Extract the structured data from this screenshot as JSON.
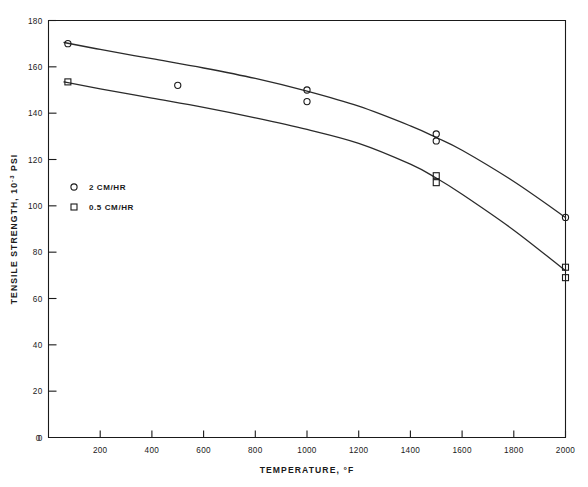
{
  "chart_data": {
    "type": "scatter",
    "title": "",
    "xlabel": "TEMPERATURE, °F",
    "ylabel": "TENSILE STRENGTH, 10⁻³ PSI",
    "ylabel_main": "TENSILE STRENGTH, 10",
    "ylabel_exponent": "-3",
    "ylabel_tail": " PSI",
    "xlim": [
      0,
      2000
    ],
    "ylim": [
      0,
      180
    ],
    "grid": false,
    "legend_position": "inside-left",
    "xticks": [
      0,
      200,
      400,
      600,
      800,
      1000,
      1200,
      1400,
      1600,
      1800,
      2000
    ],
    "xticklabels": [
      "0",
      "200",
      "400",
      "600",
      "800",
      "1000",
      "1200",
      "1400",
      "1600",
      "1800",
      "2000"
    ],
    "yticks": [
      0,
      20,
      40,
      60,
      80,
      100,
      120,
      140,
      160,
      180
    ],
    "yticklabels": [
      "0",
      "20",
      "40",
      "60",
      "80",
      "100",
      "120",
      "140",
      "160",
      "180"
    ],
    "series": [
      {
        "name": "2 CM/HR",
        "marker": "circle",
        "points": [
          {
            "x": 75,
            "y": 170
          },
          {
            "x": 500,
            "y": 152
          },
          {
            "x": 1000,
            "y": 150
          },
          {
            "x": 1000,
            "y": 145
          },
          {
            "x": 1500,
            "y": 131
          },
          {
            "x": 1500,
            "y": 128
          },
          {
            "x": 2000,
            "y": 95
          }
        ],
        "fit_curve": [
          {
            "x": 60,
            "y": 170.5
          },
          {
            "x": 200,
            "y": 167.5
          },
          {
            "x": 400,
            "y": 163.5
          },
          {
            "x": 600,
            "y": 159.5
          },
          {
            "x": 800,
            "y": 155
          },
          {
            "x": 1000,
            "y": 149.5
          },
          {
            "x": 1200,
            "y": 143
          },
          {
            "x": 1400,
            "y": 134.5
          },
          {
            "x": 1500,
            "y": 129.5
          },
          {
            "x": 1600,
            "y": 124
          },
          {
            "x": 1800,
            "y": 110.5
          },
          {
            "x": 2000,
            "y": 95
          }
        ]
      },
      {
        "name": "0.5 CM/HR",
        "marker": "square",
        "points": [
          {
            "x": 75,
            "y": 153.5
          },
          {
            "x": 1500,
            "y": 113
          },
          {
            "x": 1500,
            "y": 110
          },
          {
            "x": 2000,
            "y": 73.5
          },
          {
            "x": 2000,
            "y": 69
          }
        ],
        "fit_curve": [
          {
            "x": 60,
            "y": 153.5
          },
          {
            "x": 200,
            "y": 150.5
          },
          {
            "x": 400,
            "y": 146.5
          },
          {
            "x": 600,
            "y": 142.5
          },
          {
            "x": 800,
            "y": 138
          },
          {
            "x": 1000,
            "y": 133
          },
          {
            "x": 1200,
            "y": 127
          },
          {
            "x": 1400,
            "y": 118
          },
          {
            "x": 1500,
            "y": 112
          },
          {
            "x": 1600,
            "y": 105
          },
          {
            "x": 1800,
            "y": 89.5
          },
          {
            "x": 2000,
            "y": 72
          }
        ]
      }
    ],
    "legend": [
      {
        "marker": "circle",
        "label": "2 CM/HR"
      },
      {
        "marker": "square",
        "label": "0.5 CM/HR"
      }
    ]
  }
}
